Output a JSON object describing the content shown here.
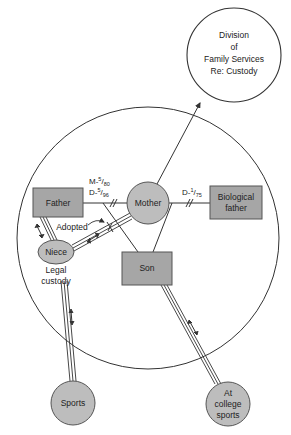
{
  "diagram": {
    "type": "ecomap",
    "colors": {
      "node_fill": "#a6a6a6",
      "circle_node_fill": "#bdbdbd",
      "stroke": "#333333",
      "background": "#ffffff"
    },
    "nodes": {
      "division": {
        "lines": [
          "Division",
          "of",
          "Family Services",
          "Re: Custody"
        ]
      },
      "father": {
        "label": "Father"
      },
      "mother": {
        "label": "Mother"
      },
      "biological_father": {
        "lines": [
          "Biological",
          "father"
        ]
      },
      "niece": {
        "label": "Niece"
      },
      "son": {
        "label": "Son"
      },
      "sports": {
        "label": "Sports"
      },
      "college_sports": {
        "lines": [
          "At",
          "college",
          "sports"
        ]
      }
    },
    "annotations": {
      "marriage": {
        "prefix": "M-",
        "num": "5",
        "den": "80"
      },
      "divorce_father": {
        "prefix": "D-",
        "num": "5",
        "den": "96"
      },
      "divorce_bio": {
        "prefix": "D-",
        "num": "1",
        "den": "75"
      },
      "adopted": "Adopted",
      "legal_custody": [
        "Legal",
        "custody"
      ]
    },
    "relationships": [
      {
        "from": "Father",
        "to": "Mother",
        "type": "divorced",
        "label": "M-5/80 D-5/96"
      },
      {
        "from": "Mother",
        "to": "Biological father",
        "type": "divorced",
        "label": "D-1/75"
      },
      {
        "from": "Mother",
        "to": "Division of Family Services Re: Custody",
        "type": "arrow"
      },
      {
        "from": "Father",
        "to": "Son",
        "type": "parent"
      },
      {
        "from": "Mother",
        "to": "Son",
        "type": "parent"
      },
      {
        "from": "Father",
        "to": "Niece",
        "type": "strong-bidirectional"
      },
      {
        "from": "Mother",
        "to": "Niece",
        "type": "strong-bidirectional",
        "label": "Adopted"
      },
      {
        "from": "Niece",
        "to": "Sports",
        "type": "strong-bidirectional"
      },
      {
        "from": "Son",
        "to": "At college sports",
        "type": "strong-bidirectional"
      }
    ]
  }
}
